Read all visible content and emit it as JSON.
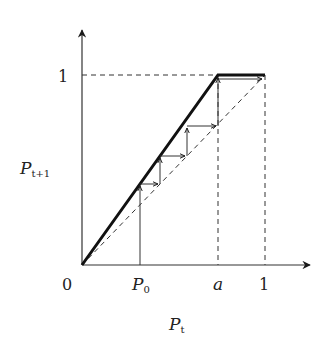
{
  "diagram": {
    "type": "cobweb",
    "labels": {
      "origin": "0",
      "y_one": "1",
      "x_p0_main": "P",
      "x_p0_sub": "0",
      "x_a": "a",
      "x_one": "1",
      "y_axis_main": "P",
      "y_axis_sub": "t+1",
      "x_axis_main": "P",
      "x_axis_sub": "t"
    },
    "params": {
      "a": 0.743,
      "P0": 0.317
    },
    "staircase_points": [
      [
        0.317,
        0.0
      ],
      [
        0.317,
        0.427
      ],
      [
        0.427,
        0.427
      ],
      [
        0.427,
        0.575
      ],
      [
        0.575,
        0.575
      ],
      [
        0.575,
        0.774
      ],
      [
        0.774,
        0.774
      ],
      [
        0.774,
        1.0
      ],
      [
        1.0,
        1.0
      ]
    ],
    "colors": {
      "ink": "#1a1a1a",
      "thin": "#444444"
    }
  }
}
